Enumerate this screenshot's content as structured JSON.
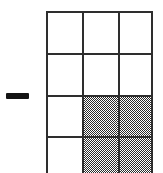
{
  "figure": {
    "background_color": "#ffffff",
    "line_color": "#2e2e2e",
    "shade_color": "#2b2b2b",
    "shade_pattern": "50-percent-checkerboard-dither"
  },
  "operator": {
    "symbol": "−",
    "name": "minus-sign",
    "x": 6,
    "y": 93,
    "width": 23,
    "height": 6
  },
  "grid": {
    "columns": 3,
    "rows": 4,
    "x": 46,
    "y": 11,
    "width": 107,
    "height": 162,
    "bottom_edge_cropped": true,
    "column_x": [
      0,
      36,
      72,
      107
    ],
    "row_y": [
      0,
      42,
      84,
      125,
      162
    ],
    "shaded_count": 4,
    "total_visible_cells": 12,
    "fraction_label": "4/12",
    "cells": [
      {
        "row": 1,
        "col": 1,
        "shaded": false
      },
      {
        "row": 1,
        "col": 2,
        "shaded": false
      },
      {
        "row": 1,
        "col": 3,
        "shaded": false
      },
      {
        "row": 2,
        "col": 1,
        "shaded": false
      },
      {
        "row": 2,
        "col": 2,
        "shaded": false
      },
      {
        "row": 2,
        "col": 3,
        "shaded": false
      },
      {
        "row": 3,
        "col": 1,
        "shaded": false
      },
      {
        "row": 3,
        "col": 2,
        "shaded": true
      },
      {
        "row": 3,
        "col": 3,
        "shaded": true
      },
      {
        "row": 4,
        "col": 1,
        "shaded": false
      },
      {
        "row": 4,
        "col": 2,
        "shaded": true
      },
      {
        "row": 4,
        "col": 3,
        "shaded": true
      }
    ],
    "horizontal_lines": [
      {
        "index": 0,
        "y": 0,
        "x": 0,
        "width": 107
      },
      {
        "index": 1,
        "y": 42,
        "x": 0,
        "width": 107
      },
      {
        "index": 2,
        "y": 84,
        "x": 0,
        "width": 107
      },
      {
        "index": 3,
        "y": 125,
        "x": 0,
        "width": 107
      }
    ],
    "vertical_lines": [
      {
        "index": 0,
        "x": 0,
        "y": 0,
        "height": 162
      },
      {
        "index": 1,
        "x": 36,
        "y": 0,
        "height": 162
      },
      {
        "index": 2,
        "x": 72,
        "y": 0,
        "height": 162
      },
      {
        "index": 3,
        "x": 105,
        "y": 0,
        "height": 162
      }
    ]
  }
}
